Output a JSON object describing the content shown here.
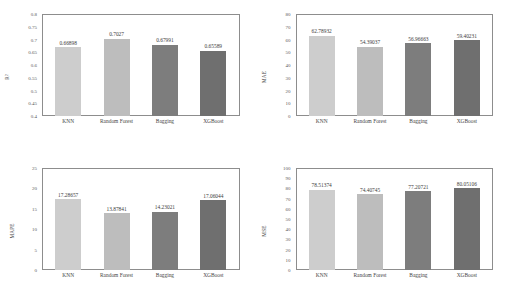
{
  "figure": {
    "categories": [
      "KNN",
      "Random Forest",
      "Bagging",
      "XGBoost"
    ],
    "bar_colors": [
      "#cdcdcd",
      "#bdbdbd",
      "#7d7d7d",
      "#6f6f6f"
    ]
  },
  "chart_data": [
    {
      "type": "bar",
      "panel": "top-left",
      "title": "",
      "xlabel": "",
      "ylabel": "R²",
      "categories": [
        "KNN",
        "Random Forest",
        "Bagging",
        "XGBoost"
      ],
      "values": [
        0.66898,
        0.7027,
        0.67991,
        0.65589
      ],
      "value_labels": [
        "0.66898",
        "0.7027",
        "0.67991",
        "0.65589"
      ],
      "ylim": [
        0.4,
        0.8
      ],
      "yticks": [
        0.4,
        0.45,
        0.5,
        0.55,
        0.6,
        0.65,
        0.7,
        0.75,
        0.8
      ],
      "ytick_labels": [
        "0.4",
        "0.45",
        "0.5",
        "0.55",
        "0.6",
        "0.65",
        "0.7",
        "0.75",
        "0.8"
      ],
      "grid": false,
      "legend": "none"
    },
    {
      "type": "bar",
      "panel": "top-right",
      "title": "",
      "xlabel": "",
      "ylabel": "MAE",
      "categories": [
        "KNN",
        "Random Forest",
        "Bagging",
        "XGBoost"
      ],
      "values": [
        62.78932,
        54.39037,
        56.96663,
        59.40231
      ],
      "value_labels": [
        "62.78932",
        "54.39037",
        "56.96663",
        "59.40231"
      ],
      "ylim": [
        0,
        80
      ],
      "yticks": [
        0,
        10,
        20,
        30,
        40,
        50,
        60,
        70,
        80
      ],
      "ytick_labels": [
        "0",
        "10",
        "20",
        "30",
        "40",
        "50",
        "60",
        "70",
        "80"
      ],
      "grid": false,
      "legend": "none"
    },
    {
      "type": "bar",
      "panel": "bottom-left",
      "title": "",
      "xlabel": "",
      "ylabel": "MAPE",
      "categories": [
        "KNN",
        "Random Forest",
        "Bagging",
        "XGBoost"
      ],
      "values": [
        17.28657,
        13.87841,
        14.23021,
        17.06044
      ],
      "value_labels": [
        "17.28657",
        "13.87841",
        "14.23021",
        "17.06044"
      ],
      "ylim": [
        0,
        25
      ],
      "yticks": [
        0,
        5,
        10,
        15,
        20,
        25
      ],
      "ytick_labels": [
        "0",
        "5",
        "10",
        "15",
        "20",
        "25"
      ],
      "grid": false,
      "legend": "none"
    },
    {
      "type": "bar",
      "panel": "bottom-right",
      "title": "",
      "xlabel": "",
      "ylabel": "MSE",
      "categories": [
        "KNN",
        "Random Forest",
        "Bagging",
        "XGBoost"
      ],
      "values": [
        78.51374,
        74.40745,
        77.20721,
        80.05106
      ],
      "value_labels": [
        "78.51374",
        "74.40745",
        "77.20721",
        "80.05106"
      ],
      "ylim": [
        0,
        100
      ],
      "yticks": [
        0,
        10,
        20,
        30,
        40,
        50,
        60,
        70,
        80,
        90,
        100
      ],
      "ytick_labels": [
        "0",
        "10",
        "20",
        "30",
        "40",
        "50",
        "60",
        "70",
        "80",
        "90",
        "100"
      ],
      "grid": false,
      "legend": "none"
    }
  ]
}
